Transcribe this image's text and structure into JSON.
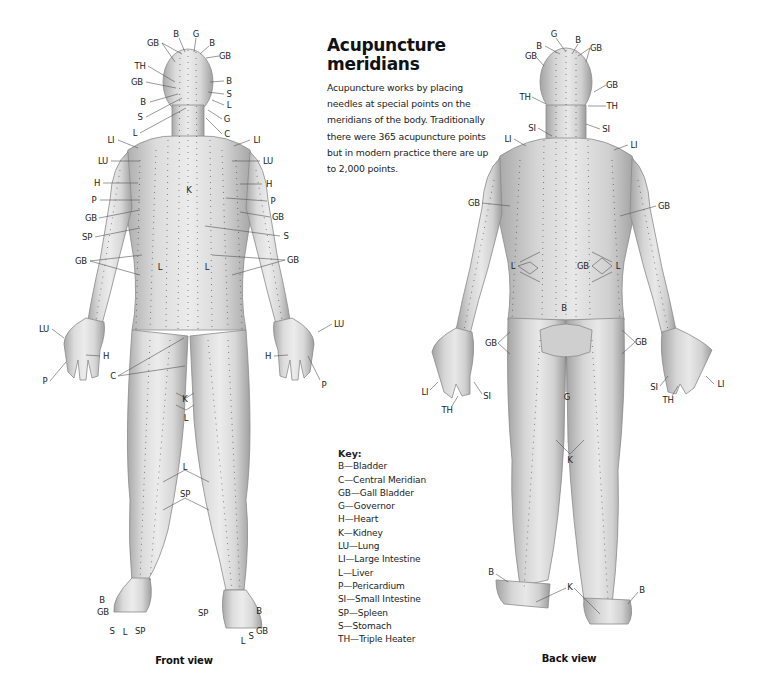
{
  "title": "Acupuncture meridians",
  "intro": "Acupuncture works by placing needles at special points on the meridians of the body. Traditionally there were 365 acupuncture points but in modern practice there are up to 2,000 points.",
  "key": {
    "title": "Key:",
    "items": [
      {
        "code": "B",
        "name": "Bladder",
        "text": "B—Bladder"
      },
      {
        "code": "C",
        "name": "Central Meridian",
        "text": "C—Central Meridian"
      },
      {
        "code": "GB",
        "name": "Gall Bladder",
        "text": "GB—Gall Bladder"
      },
      {
        "code": "G",
        "name": "Governor",
        "text": "G—Governor"
      },
      {
        "code": "H",
        "name": "Heart",
        "text": "H—Heart"
      },
      {
        "code": "K",
        "name": "Kidney",
        "text": "K—Kidney"
      },
      {
        "code": "LU",
        "name": "Lung",
        "text": "LU—Lung"
      },
      {
        "code": "LI",
        "name": "Large Intestine",
        "text": "LI—Large Intestine"
      },
      {
        "code": "L",
        "name": "Liver",
        "text": "L—Liver"
      },
      {
        "code": "P",
        "name": "Pericardium",
        "text": "P—Pericardium"
      },
      {
        "code": "SI",
        "name": "Small Intestine",
        "text": "SI—Small Intestine"
      },
      {
        "code": "SP",
        "name": "Spleen",
        "text": "SP—Spleen"
      },
      {
        "code": "S",
        "name": "Stomach",
        "text": "S—Stomach"
      },
      {
        "code": "TH",
        "name": "Triple Heater",
        "text": "TH—Triple Heater"
      }
    ]
  },
  "front_view": {
    "caption": "Front view",
    "labels": [
      {
        "t": "B",
        "x": 176,
        "y": 34
      },
      {
        "t": "G",
        "x": 196,
        "y": 34
      },
      {
        "t": "GB",
        "x": 153,
        "y": 43
      },
      {
        "t": "B",
        "x": 212,
        "y": 43
      },
      {
        "t": "GB",
        "x": 225,
        "y": 56
      },
      {
        "t": "TH",
        "x": 140,
        "y": 66
      },
      {
        "t": "GB",
        "x": 137,
        "y": 82
      },
      {
        "t": "B",
        "x": 229,
        "y": 81
      },
      {
        "t": "S",
        "x": 229,
        "y": 94
      },
      {
        "t": "B",
        "x": 143,
        "y": 102
      },
      {
        "t": "L",
        "x": 229,
        "y": 105
      },
      {
        "t": "S",
        "x": 140,
        "y": 117
      },
      {
        "t": "G",
        "x": 227,
        "y": 119
      },
      {
        "t": "L",
        "x": 135,
        "y": 133
      },
      {
        "t": "C",
        "x": 227,
        "y": 134
      },
      {
        "t": "LI",
        "x": 111,
        "y": 140
      },
      {
        "t": "LI",
        "x": 257,
        "y": 140
      },
      {
        "t": "LU",
        "x": 103,
        "y": 161
      },
      {
        "t": "LU",
        "x": 268,
        "y": 161
      },
      {
        "t": "K",
        "x": 189,
        "y": 190
      },
      {
        "t": "H",
        "x": 97,
        "y": 183
      },
      {
        "t": "H",
        "x": 269,
        "y": 184
      },
      {
        "t": "P",
        "x": 94,
        "y": 200
      },
      {
        "t": "P",
        "x": 273,
        "y": 201
      },
      {
        "t": "GB",
        "x": 91,
        "y": 218
      },
      {
        "t": "GB",
        "x": 278,
        "y": 217
      },
      {
        "t": "SP",
        "x": 87,
        "y": 237
      },
      {
        "t": "S",
        "x": 286,
        "y": 236
      },
      {
        "t": "GB",
        "x": 81,
        "y": 261
      },
      {
        "t": "GB",
        "x": 293,
        "y": 260
      },
      {
        "t": "L",
        "x": 160,
        "y": 267
      },
      {
        "t": "L",
        "x": 207,
        "y": 267
      },
      {
        "t": "LU",
        "x": 44,
        "y": 329
      },
      {
        "t": "LU",
        "x": 339,
        "y": 324
      },
      {
        "t": "H",
        "x": 106,
        "y": 356
      },
      {
        "t": "H",
        "x": 268,
        "y": 356
      },
      {
        "t": "P",
        "x": 45,
        "y": 381
      },
      {
        "t": "P",
        "x": 324,
        "y": 385
      },
      {
        "t": "C",
        "x": 113,
        "y": 376
      },
      {
        "t": "K",
        "x": 185,
        "y": 399
      },
      {
        "t": "L",
        "x": 186,
        "y": 418
      },
      {
        "t": "L",
        "x": 185,
        "y": 467
      },
      {
        "t": "SP",
        "x": 185,
        "y": 494
      },
      {
        "t": "B",
        "x": 102,
        "y": 600
      },
      {
        "t": "GB",
        "x": 103,
        "y": 612
      },
      {
        "t": "S",
        "x": 112,
        "y": 631
      },
      {
        "t": "L",
        "x": 125,
        "y": 632
      },
      {
        "t": "SP",
        "x": 140,
        "y": 631
      },
      {
        "t": "SP",
        "x": 203,
        "y": 613
      },
      {
        "t": "B",
        "x": 259,
        "y": 611
      },
      {
        "t": "GB",
        "x": 262,
        "y": 631
      },
      {
        "t": "S",
        "x": 251,
        "y": 636
      },
      {
        "t": "L",
        "x": 243,
        "y": 641
      }
    ]
  },
  "back_view": {
    "caption": "Back view",
    "labels": [
      {
        "t": "G",
        "x": 554,
        "y": 34
      },
      {
        "t": "B",
        "x": 578,
        "y": 40
      },
      {
        "t": "B",
        "x": 539,
        "y": 46
      },
      {
        "t": "GB",
        "x": 596,
        "y": 48
      },
      {
        "t": "GB",
        "x": 531,
        "y": 56
      },
      {
        "t": "GB",
        "x": 612,
        "y": 85
      },
      {
        "t": "TH",
        "x": 525,
        "y": 97
      },
      {
        "t": "TH",
        "x": 612,
        "y": 106
      },
      {
        "t": "SI",
        "x": 532,
        "y": 128
      },
      {
        "t": "SI",
        "x": 606,
        "y": 129
      },
      {
        "t": "LI",
        "x": 508,
        "y": 139
      },
      {
        "t": "LI",
        "x": 634,
        "y": 145
      },
      {
        "t": "GB",
        "x": 474,
        "y": 203
      },
      {
        "t": "GB",
        "x": 664,
        "y": 206
      },
      {
        "t": "L",
        "x": 513,
        "y": 266
      },
      {
        "t": "GB",
        "x": 583,
        "y": 266
      },
      {
        "t": "L",
        "x": 618,
        "y": 266
      },
      {
        "t": "B",
        "x": 564,
        "y": 308
      },
      {
        "t": "GB",
        "x": 491,
        "y": 343
      },
      {
        "t": "GB",
        "x": 641,
        "y": 342
      },
      {
        "t": "LI",
        "x": 425,
        "y": 392
      },
      {
        "t": "SI",
        "x": 487,
        "y": 396
      },
      {
        "t": "TH",
        "x": 447,
        "y": 410
      },
      {
        "t": "G",
        "x": 567,
        "y": 397
      },
      {
        "t": "SI",
        "x": 654,
        "y": 387
      },
      {
        "t": "LI",
        "x": 721,
        "y": 384
      },
      {
        "t": "TH",
        "x": 668,
        "y": 400
      },
      {
        "t": "K",
        "x": 570,
        "y": 460
      },
      {
        "t": "B",
        "x": 491,
        "y": 572
      },
      {
        "t": "K",
        "x": 570,
        "y": 587
      },
      {
        "t": "B",
        "x": 642,
        "y": 590
      }
    ]
  },
  "colors": {
    "skin_light": "#e6e6e6",
    "skin_mid": "#c8c8c8",
    "skin_dark": "#9a9a9a",
    "meridian_line": "#333333",
    "text": "#1a1a1a",
    "background": "#ffffff"
  }
}
